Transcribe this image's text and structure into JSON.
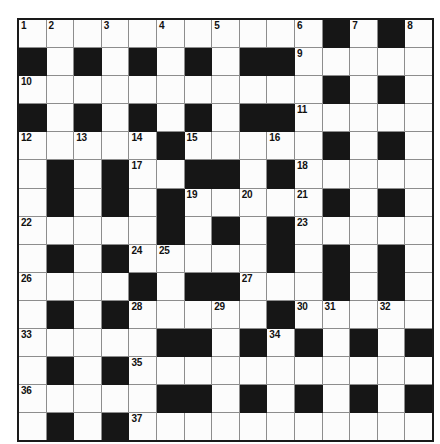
{
  "puzzle": {
    "type": "crossword-grid",
    "rows": 15,
    "columns": 15,
    "cell_size_px": 27,
    "colors": {
      "block": "#161616",
      "cell": "#fcfcfc",
      "grid_line": "#8d8d8d",
      "border": "#1a1a1a",
      "number_text": "#111111"
    },
    "legend": {
      "1": "block / shaded square",
      "0": "open / white square"
    },
    "blocks": [
      [
        0,
        0,
        0,
        0,
        0,
        0,
        0,
        0,
        0,
        0,
        0,
        1,
        0,
        1,
        0
      ],
      [
        1,
        0,
        1,
        0,
        1,
        0,
        1,
        0,
        1,
        1,
        0,
        0,
        0,
        0,
        0
      ],
      [
        0,
        0,
        0,
        0,
        0,
        0,
        0,
        0,
        0,
        0,
        0,
        1,
        0,
        1,
        0
      ],
      [
        1,
        0,
        1,
        0,
        1,
        0,
        1,
        0,
        1,
        1,
        0,
        0,
        0,
        0,
        0
      ],
      [
        0,
        0,
        0,
        0,
        0,
        1,
        0,
        0,
        0,
        0,
        0,
        1,
        0,
        1,
        0
      ],
      [
        0,
        1,
        0,
        1,
        0,
        0,
        1,
        1,
        0,
        1,
        0,
        0,
        0,
        0,
        0
      ],
      [
        0,
        1,
        0,
        1,
        0,
        1,
        0,
        0,
        0,
        0,
        0,
        1,
        0,
        1,
        0
      ],
      [
        0,
        0,
        0,
        0,
        0,
        1,
        0,
        1,
        0,
        1,
        0,
        0,
        0,
        0,
        0
      ],
      [
        0,
        1,
        0,
        1,
        0,
        0,
        0,
        0,
        0,
        1,
        0,
        1,
        0,
        1,
        0
      ],
      [
        0,
        0,
        0,
        0,
        1,
        0,
        1,
        1,
        0,
        0,
        0,
        1,
        0,
        1,
        0
      ],
      [
        0,
        1,
        0,
        1,
        0,
        0,
        0,
        0,
        0,
        1,
        0,
        0,
        0,
        0,
        0
      ],
      [
        0,
        0,
        0,
        0,
        0,
        1,
        1,
        0,
        1,
        0,
        1,
        0,
        1,
        0,
        1
      ],
      [
        0,
        1,
        0,
        1,
        0,
        0,
        0,
        0,
        0,
        0,
        0,
        0,
        0,
        0,
        0
      ],
      [
        0,
        0,
        0,
        0,
        0,
        1,
        1,
        0,
        1,
        0,
        1,
        0,
        1,
        0,
        1
      ],
      [
        0,
        1,
        0,
        1,
        0,
        0,
        0,
        0,
        0,
        0,
        0,
        0,
        0,
        0,
        0
      ]
    ],
    "numbers": [
      {
        "row": 1,
        "col": 1,
        "label": "1"
      },
      {
        "row": 1,
        "col": 2,
        "label": "2"
      },
      {
        "row": 1,
        "col": 4,
        "label": "3"
      },
      {
        "row": 1,
        "col": 6,
        "label": "4"
      },
      {
        "row": 1,
        "col": 8,
        "label": "5"
      },
      {
        "row": 1,
        "col": 11,
        "label": "6"
      },
      {
        "row": 1,
        "col": 13,
        "label": "7"
      },
      {
        "row": 1,
        "col": 15,
        "label": "8"
      },
      {
        "row": 2,
        "col": 11,
        "label": "9"
      },
      {
        "row": 3,
        "col": 1,
        "label": "10"
      },
      {
        "row": 4,
        "col": 11,
        "label": "11"
      },
      {
        "row": 5,
        "col": 1,
        "label": "12"
      },
      {
        "row": 5,
        "col": 3,
        "label": "13"
      },
      {
        "row": 5,
        "col": 5,
        "label": "14"
      },
      {
        "row": 5,
        "col": 7,
        "label": "15"
      },
      {
        "row": 5,
        "col": 10,
        "label": "16"
      },
      {
        "row": 6,
        "col": 5,
        "label": "17"
      },
      {
        "row": 6,
        "col": 11,
        "label": "18"
      },
      {
        "row": 7,
        "col": 7,
        "label": "19"
      },
      {
        "row": 7,
        "col": 9,
        "label": "20"
      },
      {
        "row": 7,
        "col": 11,
        "label": "21"
      },
      {
        "row": 8,
        "col": 1,
        "label": "22"
      },
      {
        "row": 8,
        "col": 11,
        "label": "23"
      },
      {
        "row": 9,
        "col": 5,
        "label": "24"
      },
      {
        "row": 9,
        "col": 6,
        "label": "25"
      },
      {
        "row": 10,
        "col": 1,
        "label": "26"
      },
      {
        "row": 10,
        "col": 9,
        "label": "27"
      },
      {
        "row": 11,
        "col": 5,
        "label": "28"
      },
      {
        "row": 11,
        "col": 8,
        "label": "29"
      },
      {
        "row": 11,
        "col": 11,
        "label": "30"
      },
      {
        "row": 11,
        "col": 12,
        "label": "31"
      },
      {
        "row": 11,
        "col": 14,
        "label": "32"
      },
      {
        "row": 12,
        "col": 1,
        "label": "33"
      },
      {
        "row": 12,
        "col": 10,
        "label": "34"
      },
      {
        "row": 13,
        "col": 5,
        "label": "35"
      },
      {
        "row": 14,
        "col": 1,
        "label": "36"
      },
      {
        "row": 15,
        "col": 5,
        "label": "37"
      }
    ]
  }
}
